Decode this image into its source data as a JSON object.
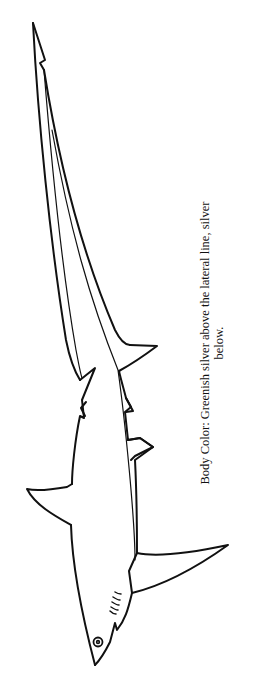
{
  "illustration": {
    "subject": "thresher shark line drawing",
    "icon": "shark-illustration",
    "line_color": "#111111",
    "background": "#ffffff"
  },
  "caption": {
    "line1": "Body Color: Greenish silver above the lateral line, silver",
    "line2": "below."
  }
}
